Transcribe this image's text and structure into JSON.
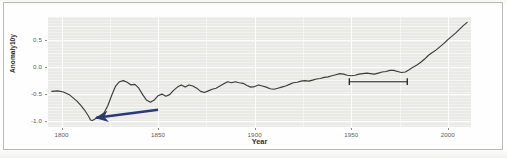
{
  "figure": {
    "background_color": "#ffffff",
    "border_color": "#b9b9b9",
    "panel_color": "#e9e9e5",
    "gridline_color": "#fdfdfc"
  },
  "chart_data": {
    "type": "line",
    "title": "",
    "subtitle": "",
    "xlabel": "Year",
    "ylabel": "Anomaly10y",
    "xlim": [
      1793,
      2012
    ],
    "ylim": [
      -1.12,
      0.92
    ],
    "grid": true,
    "legend": null,
    "legend_position": "none",
    "line_color": "#3b3b38",
    "xticks": [
      1800,
      1850,
      1900,
      1950,
      2000
    ],
    "xtick_labels": [
      "1800",
      "1850",
      "1900",
      "1950",
      "2000"
    ],
    "yticks": [
      0.5,
      0.0,
      -0.5,
      -1.0
    ],
    "ytick_labels": [
      "0.5",
      "0.0",
      "-0.5",
      "-1.0"
    ],
    "series": [
      {
        "name": "Anomaly10y",
        "x": [
          1795,
          1798,
          1801,
          1804,
          1806,
          1808,
          1810,
          1812,
          1814,
          1815,
          1816,
          1818,
          1820,
          1822,
          1824,
          1826,
          1828,
          1830,
          1832,
          1834,
          1836,
          1838,
          1840,
          1842,
          1844,
          1846,
          1848,
          1850,
          1852,
          1854,
          1856,
          1858,
          1860,
          1862,
          1864,
          1866,
          1868,
          1870,
          1872,
          1874,
          1876,
          1878,
          1880,
          1882,
          1884,
          1886,
          1888,
          1890,
          1892,
          1894,
          1896,
          1898,
          1900,
          1902,
          1904,
          1906,
          1908,
          1910,
          1912,
          1914,
          1916,
          1918,
          1920,
          1922,
          1924,
          1926,
          1928,
          1930,
          1932,
          1934,
          1936,
          1938,
          1940,
          1942,
          1944,
          1946,
          1948,
          1950,
          1952,
          1954,
          1956,
          1958,
          1960,
          1962,
          1964,
          1966,
          1968,
          1970,
          1972,
          1974,
          1976,
          1978,
          1980,
          1982,
          1984,
          1986,
          1988,
          1990,
          1992,
          1994,
          1996,
          1998,
          2000,
          2002,
          2004,
          2006,
          2008,
          2010
        ],
        "y": [
          -0.46,
          -0.45,
          -0.47,
          -0.52,
          -0.58,
          -0.64,
          -0.72,
          -0.81,
          -0.92,
          -0.99,
          -1.0,
          -0.96,
          -0.93,
          -0.86,
          -0.72,
          -0.53,
          -0.36,
          -0.28,
          -0.26,
          -0.29,
          -0.34,
          -0.33,
          -0.4,
          -0.52,
          -0.62,
          -0.66,
          -0.62,
          -0.54,
          -0.51,
          -0.55,
          -0.52,
          -0.44,
          -0.38,
          -0.34,
          -0.38,
          -0.34,
          -0.36,
          -0.4,
          -0.46,
          -0.48,
          -0.45,
          -0.42,
          -0.4,
          -0.36,
          -0.32,
          -0.28,
          -0.3,
          -0.28,
          -0.3,
          -0.31,
          -0.35,
          -0.38,
          -0.37,
          -0.34,
          -0.36,
          -0.38,
          -0.41,
          -0.42,
          -0.4,
          -0.38,
          -0.36,
          -0.33,
          -0.3,
          -0.29,
          -0.27,
          -0.26,
          -0.27,
          -0.25,
          -0.23,
          -0.22,
          -0.2,
          -0.19,
          -0.17,
          -0.15,
          -0.13,
          -0.14,
          -0.16,
          -0.17,
          -0.16,
          -0.14,
          -0.13,
          -0.12,
          -0.13,
          -0.14,
          -0.12,
          -0.1,
          -0.09,
          -0.07,
          -0.07,
          -0.09,
          -0.11,
          -0.1,
          -0.06,
          -0.01,
          0.03,
          0.08,
          0.14,
          0.21,
          0.26,
          0.31,
          0.37,
          0.43,
          0.5,
          0.56,
          0.62,
          0.69,
          0.76,
          0.82
        ]
      }
    ],
    "annotations": [
      {
        "name": "early-dip-arrow",
        "type": "arrow",
        "color": "#2a3a78",
        "direction": "left",
        "tail_x": 1850,
        "tail_y": -0.8,
        "head_x": 1818,
        "head_y": -0.95,
        "label": ""
      },
      {
        "name": "period-range-bar",
        "type": "range-bar",
        "color": "#1f1f1d",
        "x_start": 1949,
        "x_end": 1979,
        "y": -0.28,
        "label": ""
      }
    ]
  }
}
